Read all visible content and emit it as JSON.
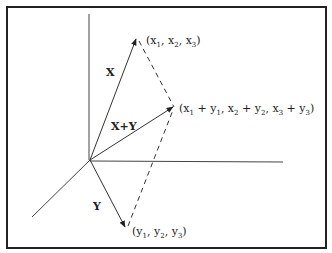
{
  "diagram": {
    "vectors": {
      "x_label": "X",
      "y_label": "Y",
      "sum_label": "X+Y"
    },
    "points": {
      "x_point": {
        "open": "(x",
        "s1": "1",
        "c1": ", x",
        "s2": "2",
        "c2": ", x",
        "s3": "3",
        "close": ")"
      },
      "y_point": {
        "open": "(y",
        "s1": "1",
        "c1": ", y",
        "s2": "2",
        "c2": ", y",
        "s3": "3",
        "close": ")"
      },
      "sum_point": {
        "p1": "(x",
        "a1": "1",
        "p2": " + y",
        "b1": "1",
        "p3": ", x",
        "a2": "2",
        "p4": " + y",
        "b2": "2",
        "p5": ", x",
        "a3": "3",
        "p6": " + y",
        "b3": "3",
        "close": ")"
      }
    },
    "colors": {
      "line": "#333333",
      "border": "#222222",
      "background": "#ffffff"
    }
  }
}
